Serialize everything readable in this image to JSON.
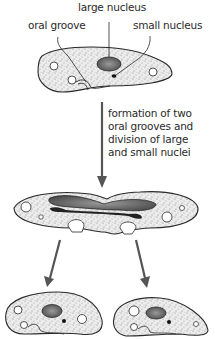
{
  "diagram": {
    "labels": {
      "large_nucleus": "large nucleus",
      "oral_groove": "oral groove",
      "small_nucleus": "small nucleus"
    },
    "caption_lines": [
      "formation of two",
      "oral grooves and",
      "division of large",
      "and small nuclei"
    ],
    "stages": [
      {
        "name": "parent cell",
        "features": [
          "oral groove",
          "large nucleus",
          "small nucleus",
          "contractile vacuoles"
        ]
      },
      {
        "name": "dividing cell",
        "features": [
          "two oral grooves",
          "elongating large nucleus",
          "dividing small nucleus"
        ]
      },
      {
        "name": "daughter cell left",
        "features": [
          "oral groove",
          "large nucleus",
          "small nucleus"
        ]
      },
      {
        "name": "daughter cell right",
        "features": [
          "oral groove",
          "large nucleus",
          "small nucleus"
        ]
      }
    ],
    "colors": {
      "outline": "#2a2a2a",
      "arrow": "#555555",
      "stipple": "#e6e6e6",
      "nucleus": "#6a6a6a"
    }
  }
}
